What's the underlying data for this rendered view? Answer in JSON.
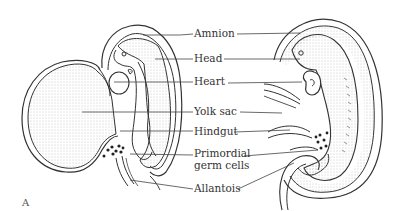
{
  "figure": {
    "panel_label": "A",
    "labels": [
      {
        "id": "amnion",
        "text": "Amnion"
      },
      {
        "id": "head",
        "text": "Head"
      },
      {
        "id": "heart",
        "text": "Heart"
      },
      {
        "id": "yolk_sac",
        "text": "Yolk sac"
      },
      {
        "id": "hindgut",
        "text": "Hindgut"
      },
      {
        "id": "primordial_germ_cells_1",
        "text": "Primordial"
      },
      {
        "id": "primordial_germ_cells_2",
        "text": "germ cells"
      },
      {
        "id": "allantois",
        "text": "Allantois"
      }
    ],
    "colors": {
      "ink": "#333333",
      "stipple": "#9a9a9a",
      "background": "#ffffff"
    }
  }
}
